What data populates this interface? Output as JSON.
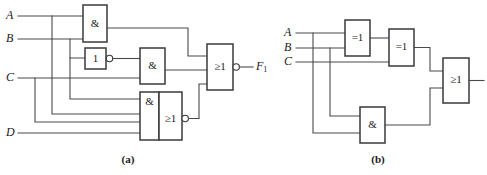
{
  "figure": {
    "background": "#ffffff",
    "wire_color": "#4a4a4a",
    "gate_stroke": "#3a3a3a",
    "width": 487,
    "height": 175
  },
  "panels": [
    {
      "id": "a",
      "caption": "(a)",
      "inputs": [
        {
          "label": "A"
        },
        {
          "label": "B"
        },
        {
          "label": "C"
        },
        {
          "label": "D"
        }
      ],
      "gates": [
        {
          "id": "and-top",
          "symbol": "&",
          "type": "and"
        },
        {
          "id": "not-1",
          "symbol": "1",
          "type": "not",
          "inverted_output": true
        },
        {
          "id": "and-mid",
          "symbol": "&",
          "type": "and"
        },
        {
          "id": "and-low",
          "symbol": "&",
          "type": "and"
        },
        {
          "id": "or-low",
          "symbol": "≥1",
          "type": "or",
          "inverted_output": true
        },
        {
          "id": "or-out",
          "symbol": "≥1",
          "type": "or",
          "inverted_output": true
        }
      ],
      "outputs": [
        {
          "label": "F",
          "subscript": "1"
        }
      ]
    },
    {
      "id": "b",
      "caption": "(b)",
      "inputs": [
        {
          "label": "A"
        },
        {
          "label": "B"
        },
        {
          "label": "C"
        }
      ],
      "gates": [
        {
          "id": "xor-1",
          "symbol": "=1",
          "type": "xor"
        },
        {
          "id": "xor-2",
          "symbol": "=1",
          "type": "xor"
        },
        {
          "id": "and-b",
          "symbol": "&",
          "type": "and"
        },
        {
          "id": "or-b",
          "symbol": "≥1",
          "type": "or"
        }
      ],
      "outputs": []
    }
  ]
}
